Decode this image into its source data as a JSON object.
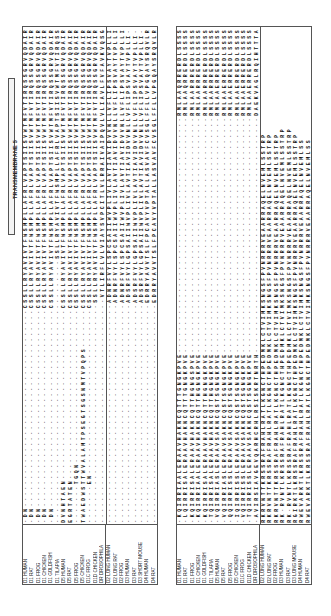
{
  "figure": {
    "region_label": "TRANSMEMBRANE 5",
    "group_separator_after_row": 13,
    "species": [
      "D1 HUMAN",
      "D1 RAT",
      "D1 FROG",
      "D1 CHICKEN",
      "D1 GOLDFISH",
      "D1 TILAPIA",
      "D5 HUMAN",
      "D5 RAT",
      "D5 FROG",
      "D5 CHICKEN",
      "D1C FROG",
      "D1D CHICKEN",
      "DR DROSOPHILA",
      "D2 LONG HUMAN",
      "D2 LONG RAT",
      "D2 FROG",
      "D3 HUMAN",
      "D3 RAT",
      "D3 SHORT MOUSE",
      "D4 HUMAN",
      "D4 RAT"
    ],
    "species_right": [
      "D1 HUMAN",
      "D1 RAT",
      "D1 FROG",
      "D1 CHICKEN",
      "D1 GOLDFISH",
      "D1 TILAPIA",
      "D5 HUMAN",
      "D5 RAT",
      "D5 FROG",
      "D5 CHICKEN",
      "D1C FROG",
      "D1D CHICKEN",
      "DR DROSOPHILA",
      "D2 LONG HUMAN",
      "D2 LONG RAT",
      "D2 FROG",
      "D3 HUMAN",
      "D3 RAT",
      "D3 LONG MOUSE",
      "D4 HUMAN",
      "D4 RAT"
    ],
    "left_panel_sequences": [
      "-DN------------------------------------CSSLLRYAVIVTFWSMPLLAFRLVAPTSIISVWTMFVTIRQSSGRVQDAIR",
      "-DN------------------------------------CSSLLRYAVIVTFWSMPLLAFRLVAPTSIISVWTMFVTIRQSSGRVQDAIR",
      "-DN------------------------------------CSSLLRYAVIVTFWSMPLLAFRLVAPTSIISVWTMFVTIRQSSGRVQDAIR",
      "-DN------------------------------------CSSLLRYAVIVTFWSMPLLAFRLVAPTSIISVWTMFVTIRQSSGRVQDAIR",
      "-DN------------------------------------CSSLLRYAVIVTFWSMPLLAFRLVAPTSIISVWTMFVTIRQSSGRVQDAIR",
      "------------------------------------------------SSLLRYAVIVTFWSMPLLAFRLVAPTSIISVWTMFVTIRQSSGRVQDAIR",
      "DVNHTAEN-------------------------------CSSLLRYAVIVTFWSMPLLAFRLVAPTSIISVWTMFVTIRQSSGRVQDAIR",
      "EGRTATEN-------------------------------CSSLLRYAVIVTFWSMPLLAFRLVAPTSIISVWTMFVTIRQSSGRVQDAIR",
      "-------TGQN----------------------------CSSLLRYAVIVTFWSMPLLAFRLVAPTSIISVWTMFVTIRQSSGRVQDAIR",
      "TWAEDWSTTWVALAMTPSEGTSGSNMTVPQPS-------CSSLLRYAVIVTFWSMPLLAFRLVAPTSIISVWTMFVTIRQSSGRVQDAIR",
      "-------EN------------------------------CSSLLRYAVIVTFWSMPLLAFRLVAPTSIISVWTMFVTIRQSSGRVQDAIR",
      "----------------------------------------SSLLRYAVIVTFWSMPLLAFRLVAPTSIISVWTMFVTIRQSSGRVQDAIR",
      "-----------------------------------------VTLIRFLVLVIAYSVPCITLVLRRAIVAIPQVLVLIAVLFVFAVKVQSGR",
      "----------------------------------------ADNRFVYLSPCSAIIWVPLIVLAVTIAVIDVVNLLVFLIPSVAYTVPLLI",
      "----------------------------------------ADNRFVYLSPCSAIIWVPLIVLAVTIAVIDVVNLLVFLIPSVAYTVPLLI",
      "----------------------------------------ADNRFVYLSPCSAIIWVPLIVLAVTIAVIDVVNLLVFLIPSVAYTVPLLI",
      "----------------------------------------ADSRFVYLGPSAIIWVPLIVLAVTIAVIDVVNLLVFLIPSVAYTVPLLI-",
      "----------------------------------------ADSRFVYLGPSAIIWVPLIVLAVTIAVIDVVNLLVFLIPSVAYTVPLLI-",
      "----------------------------------------ADSRFVYLGPSAIIWVPLIVLAVTIAVIDVVNLLVFLIPSVAYTVPLLI-",
      "----------------------------------------EDRRYAVVTSLFPCAVYVPTALLASVAVFCVSGLFFLLVPGQAYSRQVLR",
      "----------------------------------------EDRRYAVVTSLFPCAVYVPTALLASVAVFCVSGLFFLLVPGQAYSRQVLR"
    ],
    "right_panel_sequences": [
      "-KQIRRIAALERAAVHAKNCQTTTGNGKPVE-------------------------------------------RMLAAQRRERDLSSSSS",
      "-LQIRRISALERAAVHAKNCQTTTGNGKPVE-------------------------------------------RMLAAQRRERDLSSSSS",
      "-KQIRRISALERAAVHAKNCQTTHGNGSPVE-------------------------------------------RMLAARRRERDLSSSSS",
      "-KQIRRIAALERAAVHAKNCQTTHGNGKPVE-------------------------------------------RMLAARRRERDLSSSSS",
      "-KQIRRISALERAAVHAKNCQTTHGNGKPVE-------------------------------------------RMLAARRRERDLSSSSS",
      "-TQIRRISALERAAVHAKNCQTTHGNGKPVE-------------------------------------------RMLAARRRERDLSSSSS",
      "-VQIRRIASLERAAVSAKNCQSTSGNGKPVE-------------------------------------------RMLAAERRERDLSSSSS",
      "-VQIRRIASLERAAVSAKNCQSTSGNGKPVE-------------------------------------------RMLAAERRERDLSSSSS",
      "-QQIRRISSLERAAVSAKNCQSTSGNGKPVE-------------------------------------------RMLAAERRERDLSSSSS",
      "-IQIRRISSLERAAVSAKNCQSTSGNGKPVE-------------------------------------------RMLAAERRERDLSSSSS",
      "-VQIRRISSLERAAVSAKNCQSTSGNGKPVE-------------------------------------------RMLAAERRERDLSSSSS",
      "-TQIRRISSLERAAVSAKNCQSTSGNGKPVE-------------------------------------------RMLAAERRERDLSSSSS",
      "-AVIRSIAVGEVQARHCRHLRSISKRTNRTH-------------------------------------------DAEKVAGLRQIHTTTAT",
      "RKRVNTTKRSSRAFRAHLRATLKGNCTHPEDMKLCTVIMKSNGSFPVNRRRVEAARRAQELNVEMLSSTRP",
      "RKRVNTTKRSSRAFRAHLRATLKGNCTHPEDMKLCTVIMKSNGSFPVNRRRVEAARRAQELNVEMLSSTRP",
      "RKRVNTTKRSSRAFRAHLRATLKGNCTHPEDMKLCTVIMKSNGSFPVNRRRVEAARRAQELNVEMLSSTRP",
      "RK-RVNTLKRSSRAFRAHLRATLKGNCTHPEDMKLCTVIMKSNGSFPVNRRRVEAARRAQELNVEMLSSTRP",
      "RK-RVNTLKRSSRAFRAHLRATLKGNCTHPEDMKLCTVIMKSNGSFPVNRRRVEAARRAQELNVEMLSSTRP",
      "RGIRKTLKRSSRAFRAHLRATLKGNCTHPEDMKLCTVIMKSNGSFPVNRRRVEAARRAQELNVEMLSSTRP",
      "RWEVARKTLKRSSRAFRAHLRATLKGNCTHPEDMKLCTVIMKSNGSFPVNRRRVEAARRAQELNVEMLSS",
      "RWEVARKTLKRSSRAFRAHLRATLKGNCTHPEDMKLCTVIMKSNGSFPVNRRRVEAARRAQELNVEMLSS"
    ]
  }
}
